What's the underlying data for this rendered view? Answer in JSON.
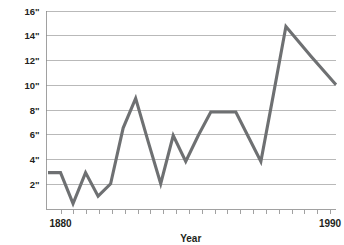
{
  "figure": {
    "background_color": "#ffffff",
    "clipped_title_fragment": "",
    "axis_color": "#8a8a8a",
    "grid_color": "#9b9b9b",
    "text_color": "#231f20"
  },
  "chart_data": {
    "type": "line",
    "title": "",
    "xlabel": "Year",
    "ylabel": "",
    "line_color": "#6e7072",
    "grid": true,
    "grid_axis": "y",
    "legend": false,
    "legend_position": "none",
    "xlim": [
      1874,
      1990
    ],
    "ylim": [
      0,
      16
    ],
    "y_tick_values": [
      2,
      4,
      6,
      8,
      10,
      12,
      14,
      16
    ],
    "y_tick_labels": [
      "2\"",
      "4\"",
      "6\"",
      "8\"",
      "10\"",
      "12\"",
      "14\"",
      "16\""
    ],
    "y_unit": "inches",
    "x_tick_count": 22,
    "x_labeled_ticks": [
      {
        "value": 1880,
        "label": "1880"
      },
      {
        "value": 1990,
        "label": "1990"
      }
    ],
    "x_tick_values": [
      1880,
      1885,
      1890,
      1895,
      1900,
      1905,
      1910,
      1915,
      1920,
      1925,
      1930,
      1935,
      1940,
      1945,
      1950,
      1955,
      1960,
      1965,
      1970,
      1975,
      1980,
      1990
    ],
    "x": [
      1875,
      1880,
      1885,
      1890,
      1895,
      1900,
      1905,
      1910,
      1915,
      1920,
      1925,
      1930,
      1935,
      1940,
      1945,
      1950,
      1955,
      1960,
      1965,
      1970,
      1980,
      1990
    ],
    "values": [
      2.9,
      2.9,
      0.4,
      2.9,
      1.0,
      2.0,
      6.5,
      8.9,
      5.4,
      2.0,
      5.9,
      3.8,
      5.9,
      7.8,
      7.8,
      7.8,
      5.8,
      3.8,
      9.2,
      14.7,
      12.3,
      10.0
    ],
    "series": [
      {
        "name": "Measurement",
        "values": [
          2.9,
          2.9,
          0.4,
          2.9,
          1.0,
          2.0,
          6.5,
          8.9,
          5.4,
          2.0,
          5.9,
          3.8,
          5.9,
          7.8,
          7.8,
          7.8,
          5.8,
          3.8,
          9.2,
          14.7,
          12.3,
          10.0
        ]
      }
    ]
  }
}
